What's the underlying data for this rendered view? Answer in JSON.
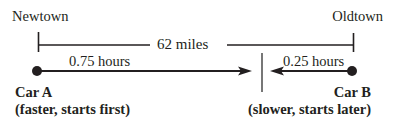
{
  "diagram": {
    "left_town": "Newtown",
    "right_town": "Oldtown",
    "distance_label": "62 miles",
    "car_a": {
      "name": "Car A",
      "description": "(faster, starts first)",
      "time_label": "0.75 hours"
    },
    "car_b": {
      "name": "Car B",
      "description": "(slower, starts later)",
      "time_label": "0.25 hours"
    },
    "colors": {
      "ink": "#231f20",
      "tick": "#555555"
    }
  }
}
